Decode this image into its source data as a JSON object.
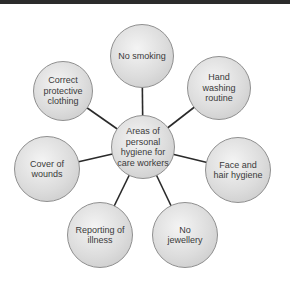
{
  "diagram": {
    "type": "spider-diagram",
    "center": {
      "label": "Areas of\npersonal\nhygiene for\ncare workers",
      "cx": 143,
      "cy": 147,
      "r": 32
    },
    "nodes": [
      {
        "label": "No smoking",
        "cx": 142,
        "cy": 56,
        "r": 32
      },
      {
        "label": "Hand\nwashing\nroutine",
        "cx": 219,
        "cy": 88,
        "r": 32
      },
      {
        "label": "Face and\nhair hygiene",
        "cx": 238,
        "cy": 170,
        "r": 33
      },
      {
        "label": "No\njewellery",
        "cx": 185,
        "cy": 235,
        "r": 33
      },
      {
        "label": "Reporting of\nillness",
        "cx": 100,
        "cy": 235,
        "r": 33
      },
      {
        "label": "Cover of\nwounds",
        "cx": 47,
        "cy": 169,
        "r": 33
      },
      {
        "label": "Correct\nprotective\nclothing",
        "cx": 63,
        "cy": 91,
        "r": 30
      }
    ],
    "colors": {
      "line": "#2a2a2a",
      "border": "#8f8f8f",
      "text": "#3a3a3a",
      "topbar": "#2b2b2b"
    }
  }
}
